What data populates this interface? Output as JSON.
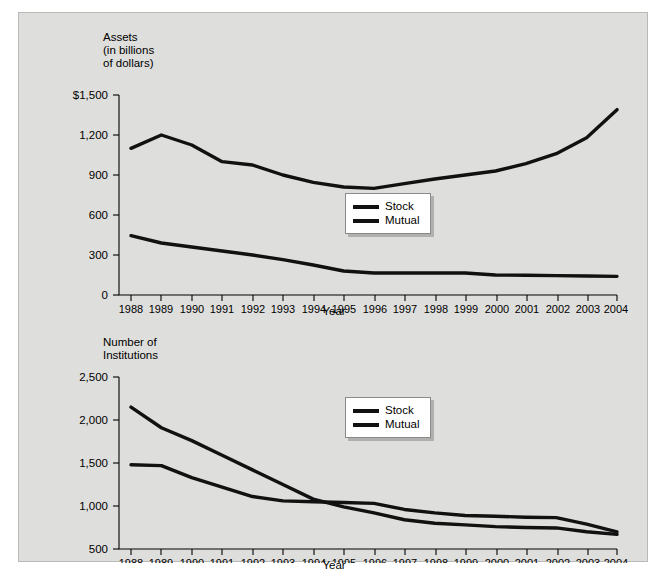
{
  "figure": {
    "background_color": "#dededc",
    "line_color": "#111111",
    "panel_border_color": "#b9b9b7"
  },
  "charts": [
    {
      "id": "assets-chart",
      "y_axis_title": "Assets\n(in billions\nof dollars)",
      "x_axis_label": "Year",
      "y_ticks": [
        "$1,500",
        "1,200",
        "900",
        "600",
        "300",
        "0"
      ],
      "x_ticks": [
        "1988",
        "1989",
        "1990",
        "1991",
        "1992",
        "1993",
        "1994",
        "1995",
        "1996",
        "1997",
        "1998",
        "1999",
        "2000",
        "2001",
        "2002",
        "2003",
        "2004"
      ],
      "legend": [
        {
          "label": "Stock",
          "swatch": "line-swatch"
        },
        {
          "label": "Mutual",
          "swatch": "line-swatch"
        }
      ]
    },
    {
      "id": "institutions-chart",
      "y_axis_title": "Number of\nInstitutions",
      "x_axis_label": "Year",
      "y_ticks": [
        "2,500",
        "2,000",
        "1,500",
        "1,000",
        "500"
      ],
      "x_ticks": [
        "1988",
        "1989",
        "1990",
        "1991",
        "1992",
        "1993",
        "1994",
        "1995",
        "1996",
        "1997",
        "1998",
        "1999",
        "2000",
        "2001",
        "2002",
        "2003",
        "2004"
      ],
      "legend": [
        {
          "label": "Stock",
          "swatch": "line-swatch"
        },
        {
          "label": "Mutual",
          "swatch": "line-swatch"
        }
      ]
    }
  ],
  "chart_data": [
    {
      "type": "line",
      "title": "Assets (in billions of dollars)",
      "xlabel": "Year",
      "ylabel": "Assets (in billions of dollars)",
      "x": [
        1988,
        1989,
        1990,
        1991,
        1992,
        1993,
        1994,
        1995,
        1996,
        1997,
        1998,
        1999,
        2000,
        2001,
        2002,
        2003,
        2004
      ],
      "ylim": [
        0,
        1500
      ],
      "ytick_values": [
        0,
        300,
        600,
        900,
        1200,
        1500
      ],
      "grid": false,
      "legend_position": "center-right",
      "series": [
        {
          "name": "Stock",
          "values": [
            1100,
            1200,
            1125,
            1000,
            975,
            900,
            845,
            810,
            800,
            835,
            870,
            900,
            930,
            985,
            1060,
            1180,
            1390
          ]
        },
        {
          "name": "Mutual",
          "values": [
            445,
            390,
            360,
            330,
            300,
            265,
            225,
            180,
            165,
            165,
            165,
            165,
            150,
            148,
            145,
            142,
            140
          ]
        }
      ]
    },
    {
      "type": "line",
      "title": "Number of Institutions",
      "xlabel": "Year",
      "ylabel": "Number of Institutions",
      "x": [
        1988,
        1989,
        1990,
        1991,
        1992,
        1993,
        1994,
        1995,
        1996,
        1997,
        1998,
        1999,
        2000,
        2001,
        2002,
        2003,
        2004
      ],
      "ylim": [
        500,
        2500
      ],
      "ytick_values": [
        500,
        1000,
        1500,
        2000,
        2500
      ],
      "grid": false,
      "legend_position": "center-right",
      "series": [
        {
          "name": "Stock",
          "values": [
            1480,
            1470,
            1330,
            1220,
            1110,
            1060,
            1050,
            1040,
            1030,
            960,
            920,
            890,
            880,
            870,
            865,
            790,
            700
          ]
        },
        {
          "name": "Mutual",
          "values": [
            2150,
            1910,
            1760,
            1590,
            1420,
            1250,
            1080,
            990,
            920,
            840,
            800,
            780,
            760,
            750,
            745,
            700,
            670
          ]
        }
      ]
    }
  ]
}
